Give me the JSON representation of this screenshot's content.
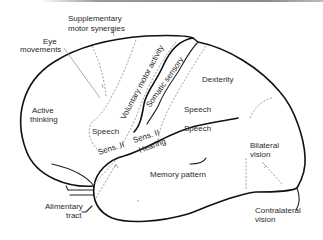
{
  "diagram": {
    "labels": {
      "supplementary_line1": "Supplementary",
      "supplementary_line2": "motor synergies",
      "eye_line1": "Eye",
      "eye_line2": "movements",
      "active_line1": "Active",
      "active_line2": "thinking",
      "voluntary_motor": "Voluntary motor activity",
      "somatic_sensory": "Somatic sensory",
      "dexterity": "Dexterity",
      "speech_upper": "Speech",
      "speech_lower": "Speech",
      "speech_left": "Speech",
      "sens_ii_left": "Sens. II",
      "sens_ii_right": "Sens. II",
      "hearing": "Hearing",
      "memory_pattern": "Memory pattern",
      "bilateral_line1": "Bilateral",
      "bilateral_line2": "vision",
      "alimentary_line1": "Alimentary",
      "alimentary_line2": "tract",
      "contralateral_line1": "Contralateral",
      "contralateral_line2": "vision"
    },
    "colors": {
      "outline": "#111111",
      "dashed_boundary": "#8a8a8a",
      "text": "#2a2a2a",
      "background": "#ffffff"
    }
  }
}
